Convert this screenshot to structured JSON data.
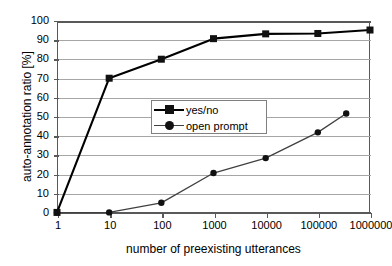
{
  "chart_data": {
    "type": "line",
    "title": "",
    "xlabel": "number of preexisting utterances",
    "ylabel": "auto-annotation ratio [%]",
    "xscale": "log",
    "xlim": [
      1,
      1000000
    ],
    "ylim": [
      0,
      100
    ],
    "ytick_labels": [
      "100",
      "90",
      "80",
      "70",
      "60",
      "50",
      "40",
      "30",
      "20",
      "10",
      "0"
    ],
    "ytick_values": [
      100,
      90,
      80,
      70,
      60,
      50,
      40,
      30,
      20,
      10,
      0
    ],
    "xtick_labels": [
      "1",
      "10",
      "100",
      "1000",
      "10000",
      "100000",
      "1000000"
    ],
    "xtick_values": [
      1,
      10,
      100,
      1000,
      10000,
      100000,
      1000000
    ],
    "grid": "horizontal",
    "legend_position": "center-left",
    "series": [
      {
        "name": "yes/no",
        "marker": "square",
        "x": [
          1,
          10,
          100,
          1000,
          10000,
          100000,
          1000000
        ],
        "values": [
          0.3,
          70.2,
          80.1,
          90.8,
          93.3,
          93.5,
          95.3
        ]
      },
      {
        "name": "open prompt",
        "marker": "circle",
        "x": [
          1,
          10,
          100,
          1000,
          10000,
          100000,
          350000
        ],
        "values": [
          0.2,
          0.3,
          5.3,
          20.8,
          28.6,
          42.0,
          51.8
        ]
      }
    ]
  },
  "legend": {
    "items": [
      {
        "label": "yes/no",
        "marker": "square"
      },
      {
        "label": "open prompt",
        "marker": "circle"
      }
    ]
  },
  "colors": {
    "series_yesno": "#000000",
    "series_open": "#404040",
    "gridline": "#a6a6a6",
    "axis": "#595959",
    "background": "#ffffff"
  }
}
